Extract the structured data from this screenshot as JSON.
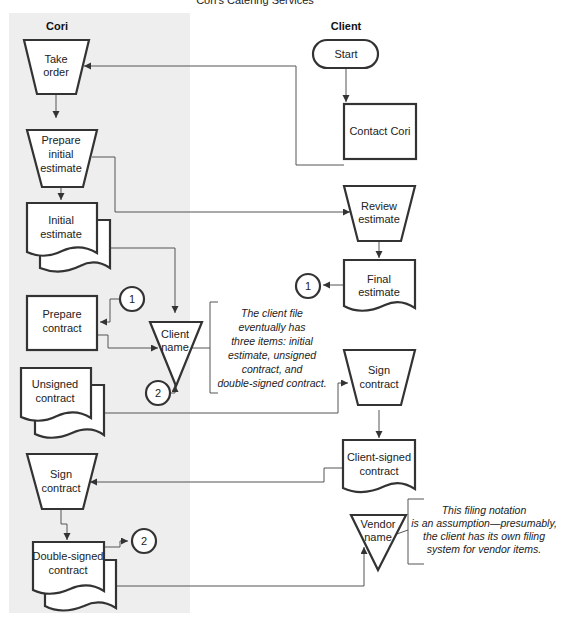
{
  "title": "Cori's Catering Services",
  "lanes": {
    "cori": {
      "label": "Cori",
      "background": "#eeeeee"
    },
    "client": {
      "label": "Client"
    }
  },
  "nodes": {
    "take_order": {
      "type": "manual-operation",
      "line1": "Take",
      "line2": "order"
    },
    "prepare_initial_estimate": {
      "type": "manual-operation",
      "line1": "Prepare",
      "line2": "initial",
      "line3": "estimate"
    },
    "initial_estimate": {
      "type": "multi-document",
      "line1": "Initial",
      "line2": "estimate"
    },
    "prepare_contract": {
      "type": "process",
      "line1": "Prepare",
      "line2": "contract"
    },
    "client_name_file": {
      "type": "offline-file",
      "line1": "Client",
      "line2": "name"
    },
    "unsigned_contract": {
      "type": "multi-document",
      "line1": "Unsigned",
      "line2": "contract"
    },
    "cori_sign_contract": {
      "type": "manual-operation",
      "line1": "Sign",
      "line2": "contract"
    },
    "double_signed_contract": {
      "type": "multi-document",
      "line1": "Double-signed",
      "line2": "contract"
    },
    "start": {
      "type": "terminator",
      "line1": "Start"
    },
    "contact_cori": {
      "type": "process",
      "line1": "Contact Cori"
    },
    "review_estimate": {
      "type": "manual-operation",
      "line1": "Review",
      "line2": "estimate"
    },
    "final_estimate": {
      "type": "document",
      "line1": "Final",
      "line2": "estimate"
    },
    "client_sign_contract": {
      "type": "manual-operation",
      "line1": "Sign",
      "line2": "contract"
    },
    "client_signed_contract": {
      "type": "document",
      "line1": "Client-signed",
      "line2": "contract"
    },
    "vendor_name_file": {
      "type": "offline-file",
      "line1": "Vendor",
      "line2": "name"
    }
  },
  "connectors": {
    "c1a": "1",
    "c1b": "1",
    "c2a": "2",
    "c2b": "2"
  },
  "annotations": {
    "client_file": [
      "The client file",
      "eventually has",
      "three items: initial",
      "estimate, unsigned",
      "contract, and",
      "double-signed contract."
    ],
    "vendor_file": [
      "This filing notation",
      "is an assumption—presumably,",
      "the client has its own filing",
      "system for vendor items."
    ]
  }
}
